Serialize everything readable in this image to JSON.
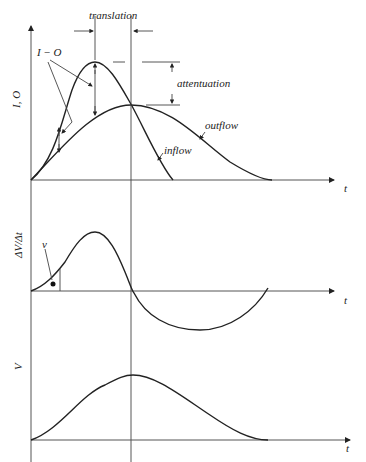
{
  "diagram": {
    "panels": [
      {
        "id": "io",
        "ylabel": "I, O",
        "xlabel": "t",
        "curves": [
          "inflow",
          "outflow"
        ],
        "annotations": [
          "translation",
          "attentuation",
          "I − O",
          "inflow",
          "outflow"
        ]
      },
      {
        "id": "dvdt",
        "ylabel": "ΔV/Δt",
        "xlabel": "t",
        "annotations": [
          "v"
        ]
      },
      {
        "id": "v",
        "ylabel": "V",
        "xlabel": "t"
      }
    ]
  },
  "labels": {
    "translation": "translation",
    "attentuation": "attentuation",
    "i_minus_o": "I − O",
    "inflow": "inflow",
    "outflow": "outflow",
    "io_axis": "I, O",
    "dvdt_axis": "ΔV/Δt",
    "v_axis": "V",
    "v_marker": "v",
    "t1": "t",
    "t2": "t",
    "t3": "t"
  }
}
